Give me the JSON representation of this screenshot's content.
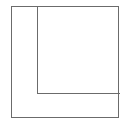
{
  "diagram": {
    "shapes": [
      {
        "type": "rectangle",
        "role": "outer-square",
        "stroke": "#6b6b6b"
      },
      {
        "type": "rectangle",
        "role": "inner-square-top-right",
        "stroke": "#6b6b6b"
      }
    ]
  }
}
